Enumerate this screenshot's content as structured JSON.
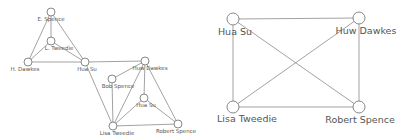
{
  "diagrams": [
    {
      "id": "left-graph",
      "nodes": [
        {
          "key": "e_spence",
          "label": "E. Spence",
          "x": 51,
          "y": 12,
          "r": 4,
          "lx": 51,
          "ly": 21
        },
        {
          "key": "l_tweedie",
          "label": "L. Tweedie",
          "x": 51,
          "y": 41,
          "r": 4,
          "lx": 59,
          "ly": 50
        },
        {
          "key": "h_dawkes",
          "label": "H. Dawkes",
          "x": 28,
          "y": 62,
          "r": 4,
          "lx": 25,
          "ly": 71
        },
        {
          "key": "hua_su_1",
          "label": "Hua Su",
          "x": 85,
          "y": 62,
          "r": 4,
          "lx": 87,
          "ly": 71
        },
        {
          "key": "huw_dawkes",
          "label": "Huw Dawkes",
          "x": 145,
          "y": 61,
          "r": 4,
          "lx": 150,
          "ly": 70
        },
        {
          "key": "bob_spence",
          "label": "Bob Spence",
          "x": 112,
          "y": 79,
          "r": 4,
          "lx": 118,
          "ly": 88
        },
        {
          "key": "hua_su_2",
          "label": "Hua Su",
          "x": 144,
          "y": 98,
          "r": 4,
          "lx": 146,
          "ly": 107
        },
        {
          "key": "lisa_tweedie",
          "label": "Lisa Tweedie",
          "x": 113,
          "y": 126,
          "r": 4,
          "lx": 117,
          "ly": 135
        },
        {
          "key": "robert_spence",
          "label": "Robert Spence",
          "x": 178,
          "y": 124,
          "r": 4,
          "lx": 176,
          "ly": 133
        }
      ],
      "edges": [
        [
          "e_spence",
          "l_tweedie"
        ],
        [
          "e_spence",
          "h_dawkes"
        ],
        [
          "e_spence",
          "hua_su_1"
        ],
        [
          "l_tweedie",
          "h_dawkes"
        ],
        [
          "l_tweedie",
          "hua_su_1"
        ],
        [
          "h_dawkes",
          "hua_su_1"
        ],
        [
          "hua_su_1",
          "huw_dawkes"
        ],
        [
          "hua_su_1",
          "lisa_tweedie"
        ],
        [
          "bob_spence",
          "huw_dawkes"
        ],
        [
          "bob_spence",
          "lisa_tweedie"
        ],
        [
          "huw_dawkes",
          "hua_su_2"
        ],
        [
          "huw_dawkes",
          "lisa_tweedie"
        ],
        [
          "huw_dawkes",
          "robert_spence"
        ],
        [
          "hua_su_2",
          "lisa_tweedie"
        ],
        [
          "hua_su_2",
          "robert_spence"
        ],
        [
          "lisa_tweedie",
          "robert_spence"
        ]
      ]
    },
    {
      "id": "right-graph",
      "nodes": [
        {
          "key": "hua_su",
          "label": "Hua Su",
          "x": 233,
          "y": 19,
          "r": 6,
          "lx": 235,
          "ly": 35
        },
        {
          "key": "huw_dawkes",
          "label": "Huw Dawkes",
          "x": 359,
          "y": 18,
          "r": 6,
          "lx": 366,
          "ly": 34
        },
        {
          "key": "lisa_tweedie",
          "label": "Lisa Tweedie",
          "x": 233,
          "y": 107,
          "r": 6,
          "lx": 247,
          "ly": 122
        },
        {
          "key": "robert_spence",
          "label": "Robert Spence",
          "x": 359,
          "y": 107,
          "r": 6,
          "lx": 360,
          "ly": 123
        }
      ],
      "edges": [
        [
          "hua_su",
          "huw_dawkes"
        ],
        [
          "hua_su",
          "lisa_tweedie"
        ],
        [
          "hua_su",
          "robert_spence"
        ],
        [
          "huw_dawkes",
          "lisa_tweedie"
        ],
        [
          "huw_dawkes",
          "robert_spence"
        ],
        [
          "lisa_tweedie",
          "robert_spence"
        ]
      ]
    }
  ]
}
